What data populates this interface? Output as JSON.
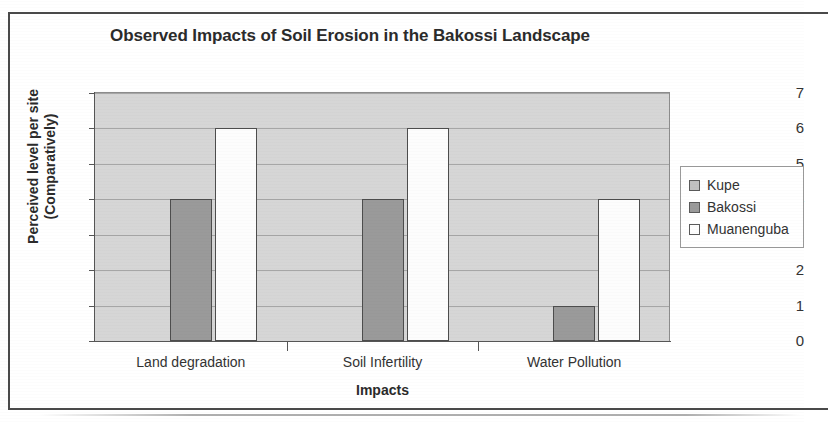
{
  "chart_data": {
    "type": "bar",
    "title": "Observed Impacts of Soil Erosion in the Bakossi Landscape",
    "xlabel": "Impacts",
    "ylabel": "Perceived level per site (Comparatively)",
    "ylabel_line1": "Perceived level per site",
    "ylabel_line2": "(Comparatively)",
    "categories": [
      "Land degradation",
      "Soil Infertility",
      "Water Pollution"
    ],
    "series": [
      {
        "name": "Kupe",
        "values": [
          0,
          0,
          0
        ],
        "color": "#c0c0c0"
      },
      {
        "name": "Bakossi",
        "values": [
          4,
          4,
          1
        ],
        "color": "#9a9a9a"
      },
      {
        "name": "Muanenguba",
        "values": [
          6,
          6,
          4
        ],
        "color": "#fdfdfd"
      }
    ],
    "ylim": [
      0,
      7
    ],
    "ytick_labels": [
      "0",
      "1",
      "2",
      "3",
      "4",
      "5",
      "6",
      "7"
    ],
    "grid": true,
    "legend_position": "right",
    "plot_background": "#d6d6d6"
  },
  "legend": {
    "items": [
      {
        "label": "Kupe",
        "color": "#c0c0c0"
      },
      {
        "label": "Bakossi",
        "color": "#9a9a9a"
      },
      {
        "label": "Muanenguba",
        "color": "#fdfdfd"
      }
    ]
  }
}
